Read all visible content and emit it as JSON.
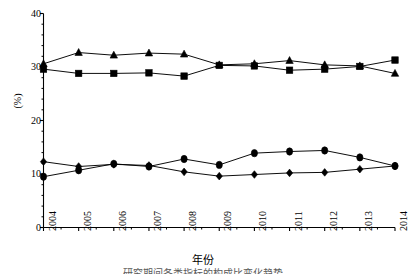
{
  "chart_data": {
    "type": "line",
    "title": "",
    "subtitle": "",
    "xlabel": "年份",
    "ylabel": "(%)",
    "categories": [
      "2004",
      "2005",
      "2006",
      "2007",
      "2008",
      "2009",
      "2010",
      "2011",
      "2012",
      "2013",
      "2014"
    ],
    "xlim": [
      2004,
      2014
    ],
    "ylim": [
      0,
      40
    ],
    "yticks": [
      0,
      10,
      20,
      30,
      40
    ],
    "xticks": [
      "2004",
      "2005",
      "2006",
      "2007",
      "2008",
      "2009",
      "2010",
      "2011",
      "2012",
      "2013",
      "2014"
    ],
    "grid": false,
    "legend": "none",
    "series": [
      {
        "name": "series-triangle",
        "marker": "triangle",
        "color": "#000000",
        "values": [
          30.6,
          32.7,
          32.2,
          32.6,
          32.4,
          30.4,
          30.6,
          31.2,
          30.4,
          30.2,
          28.8
        ]
      },
      {
        "name": "series-square",
        "marker": "square",
        "color": "#000000",
        "values": [
          29.6,
          28.8,
          28.8,
          28.9,
          28.3,
          30.3,
          30.2,
          29.4,
          29.6,
          30.1,
          31.3
        ]
      },
      {
        "name": "series-diamond",
        "marker": "diamond",
        "color": "#000000",
        "values": [
          12.3,
          11.4,
          11.8,
          11.6,
          10.4,
          9.6,
          9.9,
          10.2,
          10.3,
          10.9,
          11.5
        ]
      },
      {
        "name": "series-circle",
        "marker": "circle",
        "color": "#000000",
        "values": [
          9.5,
          10.7,
          11.9,
          11.4,
          12.8,
          11.7,
          13.9,
          14.2,
          14.4,
          13.1,
          11.5
        ]
      }
    ]
  },
  "axis": {
    "y_tick_labels": [
      "40",
      "30",
      "20",
      "10",
      "0"
    ],
    "y_axis_label": "(%)",
    "x_axis_label": "年份",
    "x_tick_labels": [
      "2004",
      "2005",
      "2006",
      "2007",
      "2008",
      "2009",
      "2010",
      "2011",
      "2012",
      "2013",
      "2014"
    ]
  },
  "caption": {
    "clipped_line": "研究期间各类指标的构成比变化趋势"
  }
}
